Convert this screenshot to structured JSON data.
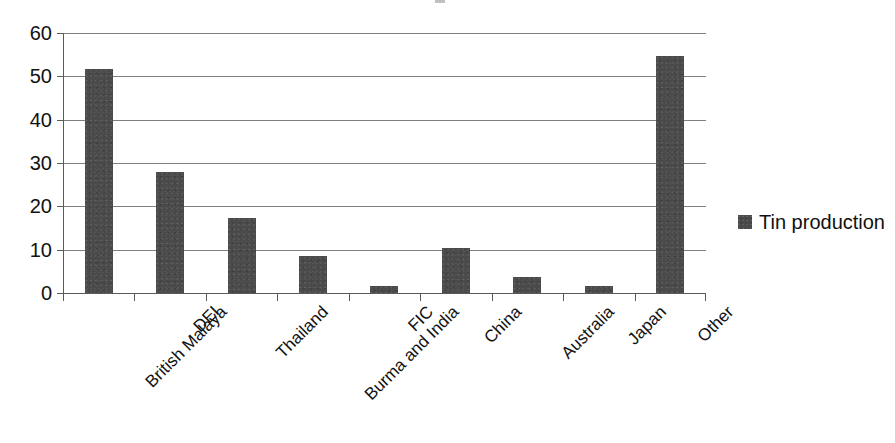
{
  "chart_data": {
    "type": "bar",
    "title": "",
    "subtitle": "",
    "xlabel": "",
    "ylabel": "",
    "categories": [
      "British Malaya",
      "DEI",
      "Thailand",
      "Burma and India",
      "FIC",
      "China",
      "Australia",
      "Japan",
      "Other"
    ],
    "series": [
      {
        "name": "Tin production",
        "values": [
          51.6,
          27.9,
          17.4,
          8.5,
          1.6,
          10.4,
          3.6,
          1.7,
          54.6
        ]
      }
    ],
    "values": [
      51.6,
      27.9,
      17.4,
      8.5,
      1.6,
      10.4,
      3.6,
      1.7,
      54.6
    ],
    "ylim": [
      0,
      60
    ],
    "yticks": [
      0,
      10,
      20,
      30,
      40,
      50,
      60
    ],
    "ytick_labels": [
      "0",
      "10",
      "20",
      "30",
      "40",
      "50",
      "60"
    ],
    "grid": true,
    "grid_axis": "y",
    "legend_position": "right",
    "legend_entries": [
      "Tin production"
    ],
    "bar_color": "#4a4a4a",
    "grid_color": "#808080",
    "axis_color": "#5a5a5a",
    "background_color": "#ffffff",
    "category_label_rotation_deg": -45
  },
  "legend": {
    "entries": [
      {
        "label": "Tin production",
        "color": "#4a4a4a",
        "marker": "square-swatch"
      }
    ]
  }
}
